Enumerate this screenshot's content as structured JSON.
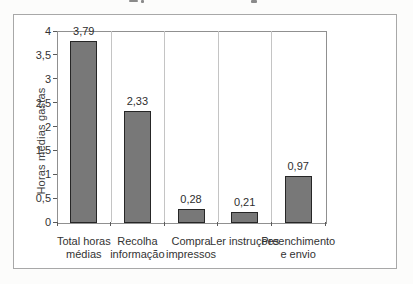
{
  "figure": {
    "background": "#ffffff",
    "frame_border": "#a8a8a8",
    "note_top_edge": "cropped text remnant from a caption cut off at top of scan"
  },
  "chart_data": {
    "type": "bar",
    "title": "",
    "xlabel": "",
    "ylabel": "Horas médias gastas",
    "categories": [
      [
        "Total horas",
        "médias"
      ],
      [
        "Recolha",
        "informação"
      ],
      [
        "Compra",
        "impressos"
      ],
      [
        "Ler instruções"
      ],
      [
        "Preenchimento",
        "e envio"
      ]
    ],
    "values": [
      3.79,
      2.33,
      0.28,
      0.21,
      0.97
    ],
    "value_labels": [
      "3,79",
      "2,33",
      "0,28",
      "0,21",
      "0,97"
    ],
    "ylim": [
      0,
      4
    ],
    "ytick_step": 0.5,
    "ytick_labels": [
      "0",
      "0,5",
      "1",
      "1,5",
      "2",
      "2,5",
      "3",
      "3,5",
      "4"
    ],
    "grid": "vertical-category-separators",
    "legend": "none",
    "bar_color": "#787878",
    "bar_border_color": "#262626",
    "decimal_separator": ","
  }
}
